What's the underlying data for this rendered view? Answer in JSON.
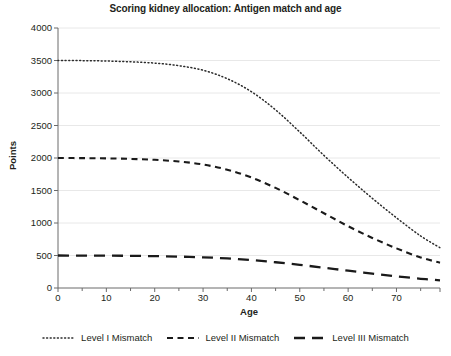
{
  "chart_data": {
    "type": "line",
    "title": "Scoring kidney allocation: Antigen match and age",
    "xlabel": "Age",
    "ylabel": "Points",
    "xlim": [
      0,
      79
    ],
    "ylim": [
      0,
      4000
    ],
    "xticks": [
      0,
      10,
      20,
      30,
      40,
      50,
      60,
      70
    ],
    "yticks": [
      0,
      500,
      1000,
      1500,
      2000,
      2500,
      3000,
      3500,
      4000
    ],
    "grid": "horizontal",
    "legend_position": "bottom",
    "x": [
      0,
      5,
      10,
      15,
      20,
      25,
      30,
      35,
      40,
      45,
      50,
      55,
      60,
      65,
      70,
      75,
      79
    ],
    "series": [
      {
        "name": "Level I Mismatch",
        "linestyle": "dotted",
        "color": "#2b2b2b",
        "values": [
          3500,
          3498,
          3492,
          3480,
          3460,
          3420,
          3350,
          3220,
          3020,
          2740,
          2400,
          2040,
          1700,
          1380,
          1080,
          800,
          620
        ]
      },
      {
        "name": "Level II Mismatch",
        "linestyle": "dashed",
        "color": "#1a1a1a",
        "values": [
          2000,
          1998,
          1994,
          1986,
          1972,
          1946,
          1900,
          1820,
          1700,
          1540,
          1350,
          1150,
          950,
          770,
          610,
          470,
          390
        ]
      },
      {
        "name": "Level III Mismatch",
        "linestyle": "long-dashed",
        "color": "#1a1a1a",
        "values": [
          500,
          499,
          498,
          495,
          490,
          483,
          472,
          455,
          430,
          396,
          356,
          312,
          266,
          222,
          180,
          142,
          118
        ]
      }
    ]
  },
  "axes": {
    "y_tick_labels": [
      "4000",
      "3500",
      "3000",
      "2500",
      "2000",
      "1500",
      "1000",
      "500",
      "0"
    ],
    "x_tick_labels": [
      "0",
      "10",
      "20",
      "30",
      "40",
      "50",
      "60",
      "70"
    ],
    "y_title": "Points",
    "x_title": "Age"
  },
  "legend": {
    "items": [
      {
        "label": "Level I Mismatch",
        "style": "dotted"
      },
      {
        "label": "Level II Mismatch",
        "style": "dashed"
      },
      {
        "label": "Level III Mismatch",
        "style": "long-dashed"
      }
    ]
  },
  "colors": {
    "background": "#ffffff",
    "text": "#231f20",
    "axis": "#6b6b6b",
    "grid": "#e8e8e8",
    "line": "#1a1a1a"
  }
}
